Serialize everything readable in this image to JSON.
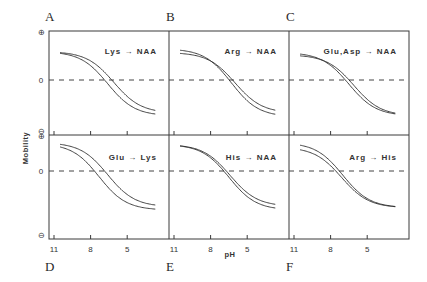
{
  "chart_data": {
    "type": "line",
    "ylabel": "Mobility",
    "xlabel": "pH",
    "x_ticks": [
      11,
      8,
      5
    ],
    "y_ticks": [
      "⊕",
      "0",
      "⊖"
    ],
    "x_range": [
      11.5,
      2
    ],
    "y_range": [
      -1,
      1
    ],
    "grid": false,
    "zero_line": "dashed",
    "panels": [
      {
        "letter": "A",
        "title": "Lys → NAA",
        "row": 0,
        "col": 0,
        "series": [
          {
            "name": "wild",
            "pKa": 6.6,
            "max": 0.62,
            "min": -0.78
          },
          {
            "name": "mutant",
            "pKa": 6.1,
            "max": 0.62,
            "min": -0.72
          }
        ]
      },
      {
        "letter": "B",
        "title": "Arg → NAA",
        "row": 0,
        "col": 1,
        "series": [
          {
            "name": "wild",
            "pKa": 6.3,
            "max": 0.68,
            "min": -0.8
          },
          {
            "name": "mutant",
            "pKa": 6.0,
            "max": 0.6,
            "min": -0.72
          }
        ]
      },
      {
        "letter": "C",
        "title": "Glu,Asp → NAA",
        "row": 0,
        "col": 2,
        "series": [
          {
            "name": "wild",
            "pKa": 6.5,
            "max": 0.6,
            "min": -0.78
          },
          {
            "name": "mutant",
            "pKa": 6.1,
            "max": 0.55,
            "min": -0.78
          }
        ]
      },
      {
        "letter": "D",
        "title": "Glu → Lys",
        "row": 1,
        "col": 0,
        "series": [
          {
            "name": "wild",
            "pKa": 7.3,
            "max": 0.6,
            "min": -0.85
          },
          {
            "name": "mutant",
            "pKa": 6.6,
            "max": 0.62,
            "min": -0.78
          }
        ]
      },
      {
        "letter": "E",
        "title": "His → NAA",
        "row": 1,
        "col": 1,
        "series": [
          {
            "name": "wild",
            "pKa": 6.5,
            "max": 0.58,
            "min": -0.85
          },
          {
            "name": "mutant",
            "pKa": 6.4,
            "max": 0.58,
            "min": -0.77
          }
        ]
      },
      {
        "letter": "F",
        "title": "Arg → His",
        "row": 1,
        "col": 2,
        "series": [
          {
            "name": "wild",
            "pKa": 7.0,
            "max": 0.62,
            "min": -0.8
          },
          {
            "name": "mutant",
            "pKa": 7.1,
            "max": 0.52,
            "min": -0.8
          }
        ]
      }
    ]
  },
  "labels": {
    "ylabel": "Mobility",
    "xlabel": "pH",
    "plus": "⊕",
    "zero": "0",
    "minus": "⊖"
  }
}
